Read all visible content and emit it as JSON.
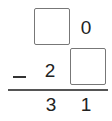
{
  "problem": {
    "operation": "subtraction",
    "minuend": {
      "tens": "",
      "ones": "0"
    },
    "operator": "−",
    "subtrahend": {
      "tens": "2",
      "ones": ""
    },
    "difference": {
      "tens": "3",
      "ones": "1"
    }
  }
}
